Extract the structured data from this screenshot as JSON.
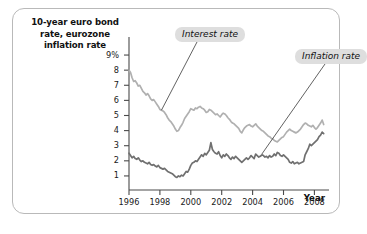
{
  "figure": {
    "y_axis_title": "10-year euro bond rate, eurozone inflation rate",
    "x_axis_title": "Year"
  },
  "chart_data": {
    "type": "line",
    "title": "",
    "xlabel": "Year",
    "ylabel": "10-year euro bond rate, eurozone inflation rate",
    "xlim": [
      1996,
      2008.75
    ],
    "ylim": [
      0.4,
      9.4
    ],
    "grid": false,
    "legend": "annotations",
    "y_ticks": [
      "9%",
      "8",
      "7",
      "6",
      "5",
      "4",
      "3",
      "2",
      "1"
    ],
    "y_tick_values": [
      9,
      8,
      7,
      6,
      5,
      4,
      3,
      2,
      1
    ],
    "x_ticks": [
      "1996",
      "1998",
      "2000",
      "2002",
      "2004",
      "2006",
      "2008"
    ],
    "x_tick_values": [
      1996,
      1998,
      2000,
      2002,
      2004,
      2006,
      2008
    ],
    "annotations": [
      {
        "text": "Interest rate",
        "target_x": 1998.1,
        "target_y": 5.35
      },
      {
        "text": "Inflation rate",
        "target_x": 2004.6,
        "target_y": 2.45
      }
    ],
    "series": [
      {
        "name": "Interest rate",
        "color": "#b0b0b0",
        "x": [
          1996.0,
          1996.1,
          1996.2,
          1996.3,
          1996.4,
          1996.5,
          1996.6,
          1996.7,
          1996.8,
          1996.9,
          1997.0,
          1997.1,
          1997.2,
          1997.3,
          1997.4,
          1997.5,
          1997.6,
          1997.7,
          1997.8,
          1997.9,
          1998.0,
          1998.1,
          1998.2,
          1998.3,
          1998.4,
          1998.5,
          1998.6,
          1998.7,
          1998.8,
          1998.9,
          1999.0,
          1999.1,
          1999.2,
          1999.3,
          1999.4,
          1999.5,
          1999.6,
          1999.7,
          1999.8,
          1999.9,
          2000.0,
          2000.1,
          2000.2,
          2000.3,
          2000.4,
          2000.5,
          2000.6,
          2000.7,
          2000.8,
          2000.9,
          2001.0,
          2001.1,
          2001.2,
          2001.3,
          2001.4,
          2001.5,
          2001.6,
          2001.7,
          2001.8,
          2001.9,
          2002.0,
          2002.1,
          2002.2,
          2002.3,
          2002.4,
          2002.5,
          2002.6,
          2002.7,
          2002.8,
          2002.9,
          2003.0,
          2003.1,
          2003.2,
          2003.3,
          2003.4,
          2003.5,
          2003.6,
          2003.7,
          2003.8,
          2003.9,
          2004.0,
          2004.1,
          2004.2,
          2004.3,
          2004.4,
          2004.5,
          2004.6,
          2004.7,
          2004.8,
          2004.9,
          2005.0,
          2005.1,
          2005.2,
          2005.3,
          2005.4,
          2005.5,
          2005.6,
          2005.7,
          2005.8,
          2005.9,
          2006.0,
          2006.1,
          2006.2,
          2006.3,
          2006.4,
          2006.5,
          2006.6,
          2006.7,
          2006.8,
          2006.9,
          2007.0,
          2007.1,
          2007.2,
          2007.3,
          2007.4,
          2007.5,
          2007.6,
          2007.7,
          2007.8,
          2007.9,
          2008.0,
          2008.1,
          2008.2,
          2008.3,
          2008.4,
          2008.5,
          2008.6
        ],
        "y": [
          8.0,
          7.85,
          7.5,
          7.25,
          7.3,
          7.15,
          6.95,
          7.0,
          6.8,
          6.6,
          6.5,
          6.35,
          6.45,
          6.3,
          6.1,
          6.0,
          6.05,
          5.9,
          5.75,
          5.6,
          5.4,
          5.35,
          5.3,
          5.2,
          5.05,
          4.85,
          4.7,
          4.6,
          4.45,
          4.3,
          4.1,
          3.95,
          4.0,
          4.2,
          4.35,
          4.55,
          4.8,
          4.95,
          5.1,
          5.25,
          5.45,
          5.4,
          5.35,
          5.5,
          5.45,
          5.55,
          5.6,
          5.5,
          5.45,
          5.35,
          5.2,
          5.25,
          5.4,
          5.35,
          5.25,
          5.15,
          5.05,
          5.1,
          5.0,
          4.9,
          5.05,
          5.15,
          5.1,
          5.0,
          4.85,
          4.75,
          4.6,
          4.5,
          4.45,
          4.35,
          4.25,
          4.15,
          3.95,
          3.85,
          4.05,
          4.2,
          4.3,
          4.35,
          4.4,
          4.3,
          4.25,
          4.35,
          4.45,
          4.3,
          4.2,
          4.1,
          4.0,
          3.95,
          3.85,
          3.75,
          3.65,
          3.6,
          3.5,
          3.45,
          3.35,
          3.3,
          3.25,
          3.35,
          3.45,
          3.55,
          3.6,
          3.75,
          3.9,
          4.0,
          4.1,
          4.0,
          3.95,
          3.9,
          3.85,
          3.9,
          4.0,
          4.1,
          4.25,
          4.4,
          4.5,
          4.45,
          4.35,
          4.3,
          4.25,
          4.35,
          4.2,
          4.1,
          4.2,
          4.35,
          4.5,
          4.7,
          4.4
        ]
      },
      {
        "name": "Inflation rate",
        "color": "#707070",
        "x": [
          1996.0,
          1996.1,
          1996.2,
          1996.3,
          1996.4,
          1996.5,
          1996.6,
          1996.7,
          1996.8,
          1996.9,
          1997.0,
          1997.1,
          1997.2,
          1997.3,
          1997.4,
          1997.5,
          1997.6,
          1997.7,
          1997.8,
          1997.9,
          1998.0,
          1998.1,
          1998.2,
          1998.3,
          1998.4,
          1998.5,
          1998.6,
          1998.7,
          1998.8,
          1998.9,
          1999.0,
          1999.1,
          1999.2,
          1999.3,
          1999.4,
          1999.5,
          1999.6,
          1999.7,
          1999.8,
          1999.9,
          2000.0,
          2000.1,
          2000.2,
          2000.3,
          2000.4,
          2000.5,
          2000.6,
          2000.7,
          2000.8,
          2000.9,
          2001.0,
          2001.1,
          2001.2,
          2001.3,
          2001.4,
          2001.5,
          2001.6,
          2001.7,
          2001.8,
          2001.9,
          2002.0,
          2002.1,
          2002.2,
          2002.3,
          2002.4,
          2002.5,
          2002.6,
          2002.7,
          2002.8,
          2002.9,
          2003.0,
          2003.1,
          2003.2,
          2003.3,
          2003.4,
          2003.5,
          2003.6,
          2003.7,
          2003.8,
          2003.9,
          2004.0,
          2004.1,
          2004.2,
          2004.3,
          2004.4,
          2004.5,
          2004.6,
          2004.7,
          2004.8,
          2004.9,
          2005.0,
          2005.1,
          2005.2,
          2005.3,
          2005.4,
          2005.5,
          2005.6,
          2005.7,
          2005.8,
          2005.9,
          2006.0,
          2006.1,
          2006.2,
          2006.3,
          2006.4,
          2006.5,
          2006.6,
          2006.7,
          2006.8,
          2006.9,
          2007.0,
          2007.1,
          2007.2,
          2007.3,
          2007.4,
          2007.5,
          2007.6,
          2007.7,
          2007.8,
          2007.9,
          2008.0,
          2008.1,
          2008.2,
          2008.3,
          2008.4,
          2008.5,
          2008.6
        ],
        "y": [
          2.5,
          2.35,
          2.2,
          2.3,
          2.15,
          2.1,
          2.2,
          2.05,
          1.95,
          2.0,
          1.9,
          1.85,
          1.8,
          1.9,
          1.75,
          1.7,
          1.75,
          1.65,
          1.6,
          1.7,
          1.55,
          1.5,
          1.45,
          1.5,
          1.4,
          1.3,
          1.25,
          1.2,
          1.15,
          1.05,
          0.95,
          0.9,
          1.0,
          0.95,
          1.05,
          1.0,
          1.15,
          1.3,
          1.25,
          1.45,
          1.7,
          1.85,
          1.9,
          2.0,
          1.95,
          2.1,
          2.25,
          2.4,
          2.3,
          2.5,
          2.4,
          2.55,
          2.7,
          3.2,
          2.75,
          2.6,
          2.5,
          2.45,
          2.6,
          2.35,
          2.2,
          2.4,
          2.3,
          2.45,
          2.35,
          2.2,
          2.1,
          2.25,
          2.15,
          2.3,
          2.2,
          2.1,
          2.0,
          1.9,
          2.0,
          2.1,
          2.2,
          2.1,
          2.2,
          2.35,
          2.25,
          2.15,
          2.45,
          2.35,
          2.25,
          2.3,
          2.4,
          2.35,
          2.25,
          2.3,
          2.2,
          2.35,
          2.25,
          2.3,
          2.45,
          2.35,
          2.55,
          2.5,
          2.35,
          2.3,
          2.4,
          2.3,
          2.2,
          2.1,
          1.9,
          1.85,
          1.95,
          1.8,
          1.85,
          1.9,
          1.8,
          1.85,
          1.9,
          1.95,
          2.4,
          2.6,
          2.8,
          3.1,
          3.0,
          3.1,
          3.2,
          3.3,
          3.4,
          3.6,
          3.7,
          3.9,
          3.8
        ]
      }
    ]
  }
}
